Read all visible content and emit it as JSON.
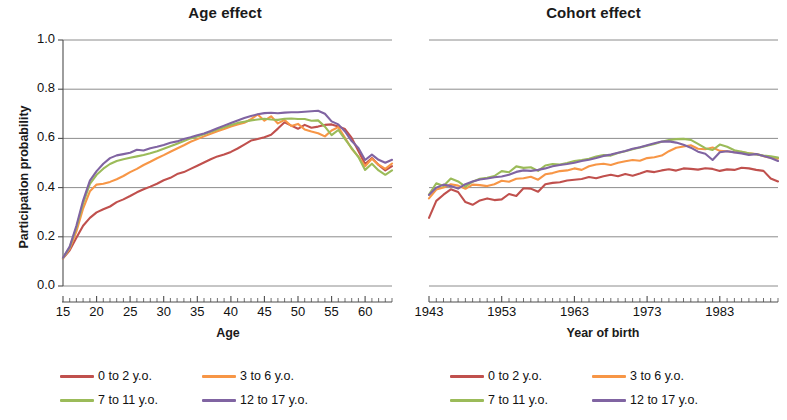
{
  "figure": {
    "ylabel": "Participation probability",
    "panels": [
      {
        "id": "age",
        "title": "Age effect",
        "xlabel": "Age",
        "xtick_labels": [
          "15",
          "20",
          "25",
          "30",
          "35",
          "40",
          "45",
          "50",
          "55",
          "60"
        ]
      },
      {
        "id": "cohort",
        "title": "Cohort effect",
        "xlabel": "Year of birth",
        "xtick_labels": [
          "1943",
          "1953",
          "1963",
          "1973",
          "1983"
        ]
      }
    ],
    "ytick_labels": [
      "0.0",
      "0.2",
      "0.4",
      "0.6",
      "0.8",
      "1.0"
    ],
    "legend": {
      "items": [
        {
          "label": "0 to 2 y.o.",
          "color": "#C0504D"
        },
        {
          "label": "3 to 6 y.o.",
          "color": "#F79646"
        },
        {
          "label": "7 to 11 y.o.",
          "color": "#9BBB59"
        },
        {
          "label": "12 to 17 y.o.",
          "color": "#8064A2"
        }
      ]
    },
    "colors": {
      "axis": "#4d4d4d",
      "grid": "#808080",
      "text": "#111111",
      "background": "#ffffff"
    }
  },
  "chart_data": [
    {
      "type": "line",
      "title": "Age effect",
      "xlabel": "Age",
      "ylabel": "Participation probability",
      "xlim": [
        15,
        64
      ],
      "ylim": [
        0.0,
        1.0
      ],
      "yticks": [
        0.0,
        0.2,
        0.4,
        0.6,
        0.8,
        1.0
      ],
      "xticks": [
        15,
        20,
        25,
        30,
        35,
        40,
        45,
        50,
        55,
        60
      ],
      "grid": true,
      "legend_position": "below",
      "x": [
        15,
        16,
        17,
        18,
        19,
        20,
        21,
        22,
        23,
        24,
        25,
        26,
        27,
        28,
        29,
        30,
        31,
        32,
        33,
        34,
        35,
        36,
        37,
        38,
        39,
        40,
        41,
        42,
        43,
        44,
        45,
        46,
        47,
        48,
        49,
        50,
        51,
        52,
        53,
        54,
        55,
        56,
        57,
        58,
        59,
        60,
        61,
        62,
        63,
        64
      ],
      "series": [
        {
          "name": "0 to 2 y.o.",
          "color": "#C0504D",
          "values": [
            0.112,
            0.145,
            0.196,
            0.245,
            0.277,
            0.299,
            0.312,
            0.323,
            0.341,
            0.352,
            0.366,
            0.381,
            0.393,
            0.404,
            0.416,
            0.43,
            0.44,
            0.455,
            0.463,
            0.476,
            0.489,
            0.502,
            0.515,
            0.527,
            0.534,
            0.545,
            0.559,
            0.575,
            0.591,
            0.597,
            0.605,
            0.615,
            0.64,
            0.666,
            0.652,
            0.639,
            0.655,
            0.643,
            0.648,
            0.655,
            0.657,
            0.648,
            0.638,
            0.602,
            0.549,
            0.496,
            0.52,
            0.492,
            0.47,
            0.487
          ]
        },
        {
          "name": "3 to 6 y.o.",
          "color": "#F79646",
          "values": [
            0.113,
            0.152,
            0.222,
            0.315,
            0.385,
            0.412,
            0.416,
            0.423,
            0.434,
            0.447,
            0.463,
            0.476,
            0.492,
            0.505,
            0.519,
            0.532,
            0.546,
            0.559,
            0.572,
            0.586,
            0.597,
            0.608,
            0.619,
            0.629,
            0.638,
            0.648,
            0.656,
            0.664,
            0.678,
            0.697,
            0.672,
            0.69,
            0.661,
            0.675,
            0.65,
            0.659,
            0.636,
            0.628,
            0.621,
            0.608,
            0.632,
            0.646,
            0.603,
            0.558,
            0.526,
            0.487,
            0.517,
            0.493,
            0.476,
            0.498
          ]
        },
        {
          "name": "7 to 11 y.o.",
          "color": "#9BBB59",
          "values": [
            0.114,
            0.157,
            0.238,
            0.336,
            0.415,
            0.452,
            0.477,
            0.496,
            0.508,
            0.515,
            0.521,
            0.527,
            0.533,
            0.54,
            0.548,
            0.558,
            0.568,
            0.578,
            0.589,
            0.6,
            0.608,
            0.617,
            0.627,
            0.636,
            0.645,
            0.655,
            0.663,
            0.668,
            0.673,
            0.677,
            0.68,
            0.677,
            0.675,
            0.68,
            0.681,
            0.679,
            0.679,
            0.672,
            0.673,
            0.648,
            0.613,
            0.634,
            0.597,
            0.56,
            0.524,
            0.472,
            0.497,
            0.47,
            0.452,
            0.47
          ]
        },
        {
          "name": "12 to 17 y.o.",
          "color": "#8064A2",
          "values": [
            0.115,
            0.16,
            0.245,
            0.347,
            0.428,
            0.467,
            0.497,
            0.52,
            0.531,
            0.536,
            0.542,
            0.554,
            0.551,
            0.56,
            0.566,
            0.573,
            0.582,
            0.588,
            0.598,
            0.605,
            0.613,
            0.62,
            0.63,
            0.641,
            0.652,
            0.663,
            0.673,
            0.683,
            0.691,
            0.698,
            0.703,
            0.704,
            0.702,
            0.705,
            0.706,
            0.706,
            0.708,
            0.71,
            0.712,
            0.7,
            0.669,
            0.657,
            0.628,
            0.589,
            0.561,
            0.512,
            0.534,
            0.513,
            0.501,
            0.513
          ]
        }
      ]
    },
    {
      "type": "line",
      "title": "Cohort effect",
      "xlabel": "Year of birth",
      "ylabel": "Participation probability",
      "xlim": [
        1943,
        1991
      ],
      "ylim": [
        0.0,
        1.0
      ],
      "yticks": [
        0.0,
        0.2,
        0.4,
        0.6,
        0.8,
        1.0
      ],
      "xticks": [
        1943,
        1953,
        1963,
        1973,
        1983
      ],
      "grid": true,
      "legend_position": "below",
      "x": [
        1943,
        1944,
        1945,
        1946,
        1947,
        1948,
        1949,
        1950,
        1951,
        1952,
        1953,
        1954,
        1955,
        1956,
        1957,
        1958,
        1959,
        1960,
        1961,
        1962,
        1963,
        1964,
        1965,
        1966,
        1967,
        1968,
        1969,
        1970,
        1971,
        1972,
        1973,
        1974,
        1975,
        1976,
        1977,
        1978,
        1979,
        1980,
        1981,
        1982,
        1983,
        1984,
        1985,
        1986,
        1987,
        1988,
        1989,
        1990,
        1991
      ],
      "series": [
        {
          "name": "0 to 2 y.o.",
          "color": "#C0504D",
          "values": [
            0.277,
            0.346,
            0.371,
            0.393,
            0.382,
            0.341,
            0.33,
            0.348,
            0.356,
            0.349,
            0.352,
            0.374,
            0.366,
            0.397,
            0.396,
            0.383,
            0.414,
            0.419,
            0.422,
            0.429,
            0.432,
            0.435,
            0.443,
            0.438,
            0.446,
            0.452,
            0.446,
            0.455,
            0.448,
            0.457,
            0.467,
            0.463,
            0.47,
            0.475,
            0.469,
            0.478,
            0.476,
            0.473,
            0.479,
            0.476,
            0.468,
            0.474,
            0.472,
            0.481,
            0.478,
            0.472,
            0.468,
            0.437,
            0.425
          ]
        },
        {
          "name": "3 to 6 y.o.",
          "color": "#F79646",
          "values": [
            0.356,
            0.392,
            0.4,
            0.414,
            0.408,
            0.395,
            0.412,
            0.41,
            0.406,
            0.414,
            0.428,
            0.424,
            0.436,
            0.438,
            0.444,
            0.432,
            0.454,
            0.459,
            0.467,
            0.47,
            0.478,
            0.472,
            0.487,
            0.494,
            0.497,
            0.492,
            0.501,
            0.507,
            0.512,
            0.509,
            0.52,
            0.523,
            0.53,
            0.548,
            0.562,
            0.567,
            0.572,
            0.558,
            0.556,
            0.563,
            0.549,
            0.548,
            0.544,
            0.546,
            0.539,
            0.536,
            0.528,
            0.522,
            0.518
          ]
        },
        {
          "name": "7 to 11 y.o.",
          "color": "#9BBB59",
          "values": [
            0.372,
            0.418,
            0.407,
            0.437,
            0.425,
            0.404,
            0.424,
            0.436,
            0.44,
            0.447,
            0.467,
            0.462,
            0.486,
            0.48,
            0.483,
            0.468,
            0.49,
            0.496,
            0.494,
            0.5,
            0.508,
            0.512,
            0.517,
            0.526,
            0.532,
            0.53,
            0.541,
            0.548,
            0.556,
            0.563,
            0.57,
            0.577,
            0.586,
            0.593,
            0.597,
            0.598,
            0.594,
            0.578,
            0.56,
            0.553,
            0.575,
            0.566,
            0.552,
            0.546,
            0.54,
            0.535,
            0.53,
            0.527,
            0.522
          ]
        },
        {
          "name": "12 to 17 y.o.",
          "color": "#8064A2",
          "values": [
            0.37,
            0.4,
            0.412,
            0.406,
            0.396,
            0.414,
            0.425,
            0.433,
            0.437,
            0.442,
            0.445,
            0.452,
            0.464,
            0.47,
            0.468,
            0.472,
            0.478,
            0.487,
            0.492,
            0.496,
            0.501,
            0.508,
            0.513,
            0.52,
            0.529,
            0.534,
            0.542,
            0.549,
            0.558,
            0.564,
            0.572,
            0.58,
            0.587,
            0.588,
            0.583,
            0.574,
            0.562,
            0.546,
            0.538,
            0.512,
            0.544,
            0.548,
            0.543,
            0.539,
            0.533,
            0.536,
            0.528,
            0.52,
            0.508
          ]
        }
      ]
    }
  ]
}
